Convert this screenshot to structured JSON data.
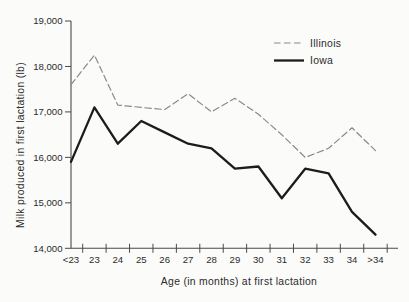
{
  "figure": {
    "background": "#fbfbfa",
    "text_color": "#2b2b2b",
    "axis_color": "#4a4a4a"
  },
  "chart_data": {
    "type": "line",
    "title": "",
    "xlabel": "Age (in months) at first lactation",
    "ylabel": "Milk produced in first lactation (lb)",
    "categories": [
      "<23",
      "23",
      "24",
      "25",
      "26",
      "27",
      "28",
      "29",
      "30",
      "31",
      "32",
      "33",
      "34",
      ">34"
    ],
    "series": [
      {
        "name": "Illinois",
        "style": "dashed",
        "color": "#8a8a8a",
        "stroke_width": 1.2,
        "values": [
          17600,
          18250,
          17150,
          17100,
          17050,
          17400,
          17000,
          17300,
          16950,
          16500,
          16000,
          16200,
          16650,
          16150
        ]
      },
      {
        "name": "Iowa",
        "style": "solid",
        "color": "#1c1c1c",
        "stroke_width": 2.3,
        "values": [
          15900,
          17100,
          16300,
          16800,
          16550,
          16300,
          16200,
          15750,
          15800,
          15100,
          15750,
          15650,
          14800,
          14300
        ]
      }
    ],
    "ylim": [
      14000,
      19000
    ],
    "ytick_step": 1000,
    "ytick_labels": [
      "14,000",
      "15,000",
      "16,000",
      "17,000",
      "18,000",
      "19,000"
    ],
    "grid": false,
    "legend_position": "top-right-inside"
  }
}
